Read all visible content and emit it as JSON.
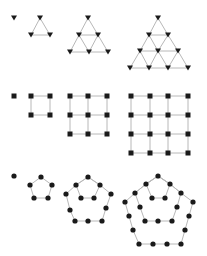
{
  "colors": {
    "edge": "#b8b8b8",
    "node": "#1a1a1a",
    "background": "#ffffff"
  },
  "rows": [
    {
      "name": "triangular",
      "marker": "triangle-down",
      "figures": [
        {
          "n": 1,
          "nodes": [
            [
              14,
              18
            ]
          ],
          "edges": []
        },
        {
          "n": 3,
          "nodes": [
            [
              40,
              18
            ],
            [
              31,
              35
            ],
            [
              50,
              35
            ]
          ],
          "edges": [
            [
              0,
              1
            ],
            [
              0,
              2
            ],
            [
              1,
              2
            ]
          ]
        },
        {
          "n": 6,
          "nodes": [
            [
              88,
              18
            ],
            [
              79,
              35
            ],
            [
              98,
              35
            ],
            [
              70,
              52
            ],
            [
              89,
              52
            ],
            [
              108,
              52
            ]
          ],
          "edges": [
            [
              0,
              1
            ],
            [
              0,
              2
            ],
            [
              1,
              2
            ],
            [
              1,
              3
            ],
            [
              1,
              4
            ],
            [
              2,
              4
            ],
            [
              2,
              5
            ],
            [
              3,
              4
            ],
            [
              4,
              5
            ]
          ]
        },
        {
          "n": 10,
          "nodes": [
            [
              158,
              18
            ],
            [
              149,
              35
            ],
            [
              168,
              35
            ],
            [
              140,
              51
            ],
            [
              158,
              51
            ],
            [
              178,
              51
            ],
            [
              130,
              68
            ],
            [
              149,
              68
            ],
            [
              168,
              68
            ],
            [
              188,
              68
            ]
          ],
          "edges": [
            [
              0,
              1
            ],
            [
              0,
              2
            ],
            [
              1,
              2
            ],
            [
              1,
              3
            ],
            [
              1,
              4
            ],
            [
              2,
              4
            ],
            [
              2,
              5
            ],
            [
              3,
              4
            ],
            [
              4,
              5
            ],
            [
              3,
              6
            ],
            [
              3,
              7
            ],
            [
              4,
              7
            ],
            [
              4,
              8
            ],
            [
              5,
              8
            ],
            [
              5,
              9
            ],
            [
              6,
              7
            ],
            [
              7,
              8
            ],
            [
              8,
              9
            ]
          ]
        }
      ]
    },
    {
      "name": "square",
      "marker": "square",
      "figures": [
        {
          "n": 1,
          "grid": {
            "xs": [
              14
            ],
            "ys": [
              96
            ]
          }
        },
        {
          "n": 4,
          "grid": {
            "xs": [
              31,
              50
            ],
            "ys": [
              96,
              115
            ]
          }
        },
        {
          "n": 9,
          "grid": {
            "xs": [
              70,
              88,
              107
            ],
            "ys": [
              96,
              115,
              134
            ]
          }
        },
        {
          "n": 16,
          "grid": {
            "xs": [
              131,
              150,
              168,
              188
            ],
            "ys": [
              96,
              115,
              134,
              153
            ]
          }
        }
      ]
    },
    {
      "name": "pentagonal",
      "marker": "circle",
      "figures": [
        {
          "n": 1,
          "nodes": [
            [
              14,
              176
            ]
          ],
          "polys": []
        },
        {
          "n": 5,
          "polys": [
            [
              [
                41,
                177
              ],
              [
                52,
                185
              ],
              [
                48,
                198
              ],
              [
                34,
                198
              ],
              [
                30,
                185
              ]
            ]
          ]
        },
        {
          "n": 12,
          "polys": [
            [
              [
                88,
                177
              ],
              [
                100,
                185
              ],
              [
                94,
                198
              ],
              [
                81,
                198
              ],
              [
                76,
                185
              ]
            ],
            [
              [
                88,
                177
              ],
              [
                100,
                185
              ],
              [
                111,
                194
              ],
              [
                106,
                208
              ],
              [
                102,
                221
              ],
              [
                88,
                221
              ],
              [
                75,
                221
              ],
              [
                70,
                210
              ],
              [
                66,
                194
              ],
              [
                76,
                185
              ]
            ]
          ]
        },
        {
          "n": 22,
          "polys": [
            [
              [
                158,
                176
              ],
              [
                170,
                184
              ],
              [
                165,
                198
              ],
              [
                152,
                198
              ],
              [
                146,
                184
              ]
            ],
            [
              [
                158,
                176
              ],
              [
                170,
                184
              ],
              [
                181,
                193
              ],
              [
                177,
                207
              ],
              [
                172,
                221
              ],
              [
                158,
                221
              ],
              [
                145,
                221
              ],
              [
                140,
                207
              ],
              [
                135,
                193
              ],
              [
                146,
                184
              ]
            ],
            [
              [
                158,
                176
              ],
              [
                170,
                184
              ],
              [
                181,
                193
              ],
              [
                193,
                202
              ],
              [
                189,
                216
              ],
              [
                185,
                230
              ],
              [
                181,
                244
              ],
              [
                167,
                244
              ],
              [
                153,
                244
              ],
              [
                139,
                244
              ],
              [
                133,
                230
              ],
              [
                129,
                216
              ],
              [
                125,
                202
              ],
              [
                135,
                193
              ],
              [
                146,
                184
              ]
            ]
          ]
        }
      ]
    }
  ]
}
